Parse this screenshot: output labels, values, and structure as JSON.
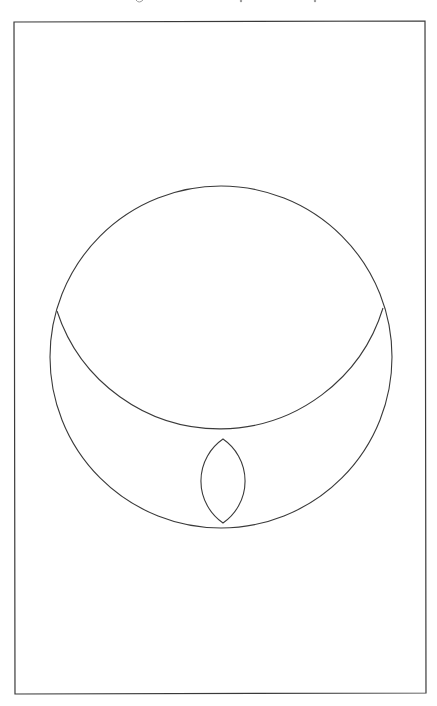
{
  "diagram": {
    "colors": {
      "background": "#ffffff",
      "stroke": "#3a3a3a"
    },
    "frame": {
      "top_left": [
        14,
        22
      ],
      "top_right": [
        425,
        21
      ],
      "bottom_right": [
        426,
        693
      ],
      "bottom_left": [
        15,
        694
      ]
    },
    "outer_circle": {
      "cx": 221,
      "cy": 357,
      "r": 171
    },
    "inner_arc": {
      "start": [
        57,
        311
      ],
      "end": [
        383,
        308
      ],
      "lowest_point": [
        221,
        432
      ],
      "radius": 171
    },
    "lens": {
      "top": [
        223,
        439
      ],
      "bottom": [
        223,
        523
      ],
      "left_extreme": 201,
      "right_extreme": 245,
      "arc_radius": 51
    },
    "top_text_fragments": {
      "note": "text above the frame is cropped; only descender marks are visible",
      "marks": [
        [
          139,
          1
        ],
        [
          241,
          1
        ],
        [
          315,
          1
        ]
      ]
    }
  }
}
